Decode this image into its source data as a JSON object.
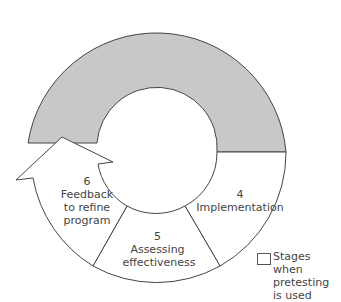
{
  "diagram": {
    "stages": [
      {
        "number": "4",
        "label": "Implementation"
      },
      {
        "number": "5",
        "label": "Assessing effectiveness"
      },
      {
        "number": "6",
        "label_lines": [
          "Feedback",
          "to refine",
          "program"
        ]
      }
    ],
    "colors": {
      "pretest_fill": "#c8c8c8",
      "stroke": "#444444",
      "text": "#444444"
    },
    "legend": {
      "lines": [
        "Stages when",
        "pretesting",
        "is used"
      ]
    }
  }
}
